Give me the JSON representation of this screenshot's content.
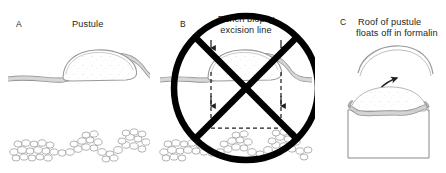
{
  "figure": {
    "kind": "medical-illustration",
    "background_color": "#ffffff",
    "ink_color": "#231f20",
    "tissue_line_color": "#8c8c8c",
    "tissue_fill_color": "#d9d9d9",
    "prohibition_color": "#000000",
    "width": 446,
    "height": 173
  },
  "panels": [
    {
      "id": "a",
      "letter": "A",
      "title": "Pustule",
      "letter_pos": {
        "x": 16,
        "y": 26
      },
      "title_pos": {
        "x": 72,
        "y": 26
      },
      "has_prohibition": false,
      "elements": [
        "intact-pustule-dome",
        "epidermis-band",
        "dermis-space",
        "fat-lobule-texture"
      ]
    },
    {
      "id": "b",
      "letter": "B",
      "title_line_1": "Punch biopsy",
      "title_line_2": "excision line",
      "letter_pos": {
        "x": 180,
        "y": 26
      },
      "title_pos": {
        "x": 246,
        "y": 22
      },
      "has_prohibition": true,
      "prohibition": {
        "shape": "circle-with-x",
        "center": {
          "x": 246,
          "y": 88
        },
        "radius": 72,
        "stroke_width": 6.5
      },
      "elements": [
        "intact-pustule-dome",
        "epidermis-band",
        "punch-excision-line-left",
        "punch-excision-line-right",
        "punch-excision-line-bottom",
        "excision-arrow-top-left",
        "excision-arrow-top-right",
        "excision-arrow-mid-left",
        "excision-arrow-mid-right",
        "fat-lobule-texture",
        "prohibition-symbol"
      ]
    },
    {
      "id": "c",
      "letter": "C",
      "title_line_1": "Roof of pustule",
      "title_line_2": "floats off in formalin",
      "letter_pos": {
        "x": 340,
        "y": 24
      },
      "title_pos": {
        "x": 352,
        "y": 24
      },
      "has_prohibition": false,
      "elements": [
        "detached-pustule-roof",
        "float-off-arrow",
        "ruptured-pustule-contents",
        "specimen-block-outline"
      ]
    }
  ],
  "annotations": {
    "arrow_count": 4,
    "arrow_direction": "down",
    "float_arrow_direction": "up-right-curved",
    "dashed_pattern": "4 3"
  }
}
